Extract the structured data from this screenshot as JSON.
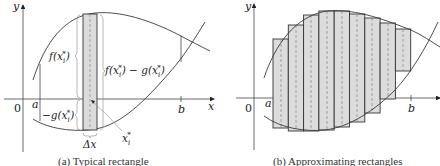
{
  "panels": [
    {
      "id": "a",
      "caption": "(a) Typical rectangle",
      "axis_labels": {
        "x": "x",
        "y": "y",
        "origin": "0",
        "a": "a",
        "b": "b"
      },
      "annotations": {
        "f_label": "f(x",
        "f_sub": "i",
        "f_sup": "*",
        "f_close": ")",
        "diff_label": "f(x",
        "diff_mid": ") − g(x",
        "diff_close": ")",
        "neg_g_label": "−g(x",
        "neg_g_close": ")",
        "delta_x": "Δx",
        "xi_star": "x",
        "xi_sub": "i",
        "xi_sup": "*",
        "star": "*",
        "i": "i"
      }
    },
    {
      "id": "b",
      "caption": "(b) Approximating rectangles",
      "axis_labels": {
        "x": "x",
        "y": "y",
        "origin": "0",
        "a": "a",
        "b": "b"
      },
      "rectangle_count": 9
    }
  ],
  "colors": {
    "rect_fill": "#dcdcdc",
    "stroke": "#333333",
    "dash": "#888888"
  }
}
